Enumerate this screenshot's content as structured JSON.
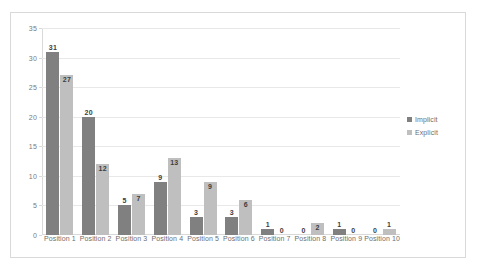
{
  "chart_data": {
    "type": "bar",
    "title": "",
    "subtitle": "",
    "xlabel": "",
    "ylabel": "",
    "ylim": [
      0,
      35
    ],
    "ytick_step": 5,
    "yticks": [
      0,
      5,
      10,
      15,
      20,
      25,
      30,
      35
    ],
    "grid": true,
    "legend_position": "right",
    "categories": [
      "Position 1",
      "Position 2",
      "Position 3",
      "Position 4",
      "Position 5",
      "Position 6",
      "Position 7",
      "Position 8",
      "Position 9",
      "Position 10"
    ],
    "series": [
      {
        "name": "Implicit",
        "color": "#808080",
        "values": [
          31,
          20,
          5,
          9,
          3,
          3,
          1,
          0,
          1,
          0
        ]
      },
      {
        "name": "Explicit",
        "color": "#bfbfbf",
        "values": [
          27,
          12,
          7,
          13,
          9,
          6,
          0,
          2,
          0,
          1
        ]
      }
    ],
    "data_labels": true,
    "colors": {
      "implicit": "#808080",
      "explicit": "#bfbfbf",
      "gridline": "#e8e8e8",
      "axis": "#d9d9d9",
      "border": "#d9d9d9",
      "tick_text": "#7a7a7a",
      "label_text": "#3d3d3d",
      "background": "#ffffff"
    }
  },
  "legend": {
    "items": [
      {
        "label": "Implicit",
        "marker": "square-swatch-dark"
      },
      {
        "label": "Explicit",
        "marker": "square-swatch-light"
      }
    ]
  }
}
